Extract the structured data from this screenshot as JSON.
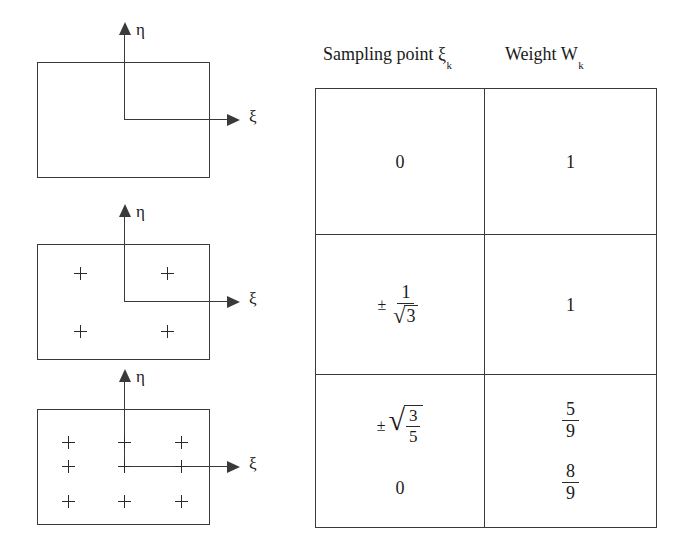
{
  "figure": {
    "axis_labels": {
      "xi": "ξ",
      "eta": "η"
    },
    "diagrams": [
      {
        "id": "one-point",
        "sampling_point_count": 0,
        "marker": "+",
        "points": []
      },
      {
        "id": "two-by-two",
        "sampling_point_count": 4,
        "marker": "+",
        "points": [
          {
            "x": 0.25,
            "y": 0.25
          },
          {
            "x": 0.75,
            "y": 0.25
          },
          {
            "x": 0.25,
            "y": 0.75
          },
          {
            "x": 0.75,
            "y": 0.75
          }
        ]
      },
      {
        "id": "three-by-three",
        "sampling_point_count": 9,
        "marker": "+",
        "points": [
          {
            "x": 0.18,
            "y": 0.18
          },
          {
            "x": 0.5,
            "y": 0.18
          },
          {
            "x": 0.82,
            "y": 0.18
          },
          {
            "x": 0.18,
            "y": 0.5
          },
          {
            "x": 0.5,
            "y": 0.5
          },
          {
            "x": 0.82,
            "y": 0.5
          },
          {
            "x": 0.18,
            "y": 0.82
          },
          {
            "x": 0.5,
            "y": 0.82
          },
          {
            "x": 0.82,
            "y": 0.82
          }
        ]
      }
    ]
  },
  "table": {
    "headers": {
      "sampling_point": "Sampling point ξ",
      "sampling_point_sub": "k",
      "weight": "Weight W",
      "weight_sub": "k"
    },
    "rows": [
      {
        "id": "row-1",
        "sampling_point": {
          "display": "0",
          "kind": "plain"
        },
        "weight": {
          "display": "2",
          "kind": "plain"
        }
      },
      {
        "id": "row-2",
        "sampling_point": {
          "display": "± 1/√3",
          "kind": "fraction-over-sqrt",
          "sign": "±",
          "numerator": "1",
          "denominator_radicand": "3",
          "radical": "√"
        },
        "weight": {
          "display": "1",
          "kind": "plain"
        }
      },
      {
        "id": "row-3",
        "sampling_point_primary": {
          "display": "±√(3/5)",
          "kind": "sqrt-of-fraction",
          "sign": "±",
          "radical": "√",
          "numerator": "3",
          "denominator": "5"
        },
        "sampling_point_secondary": {
          "display": "0",
          "kind": "plain"
        },
        "weight_primary": {
          "display": "5/9",
          "kind": "fraction",
          "numerator": "5",
          "denominator": "9"
        },
        "weight_secondary": {
          "display": "8/9",
          "kind": "fraction",
          "numerator": "8",
          "denominator": "9"
        }
      }
    ]
  },
  "colors": {
    "ink": "#1a1a1a",
    "line": "#3a3a3a",
    "background": "#ffffff"
  }
}
